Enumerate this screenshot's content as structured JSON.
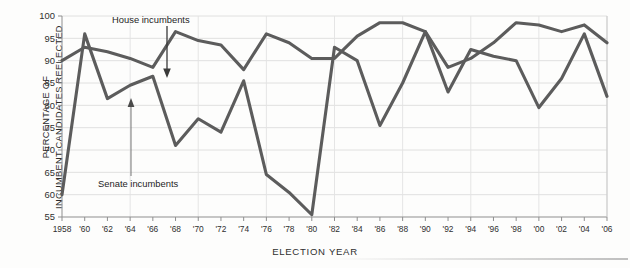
{
  "chart_data": {
    "type": "line",
    "title": "",
    "xlabel": "ELECTION YEAR",
    "ylabel_line1": "PERCENTAGE OF",
    "ylabel_line2": "INCUMBENT CANDIDATES REELECTED",
    "ylim": [
      55,
      100
    ],
    "yticks": [
      55,
      60,
      65,
      70,
      75,
      80,
      85,
      90,
      95,
      100
    ],
    "ytick_labels": [
      "55",
      "60",
      "65",
      "70",
      "75",
      "80",
      "85",
      "90",
      "95",
      "100"
    ],
    "grid": true,
    "legend_position": "inline-annotations",
    "x": [
      1958,
      1960,
      1962,
      1964,
      1966,
      1968,
      1970,
      1972,
      1974,
      1976,
      1978,
      1980,
      1982,
      1984,
      1986,
      1988,
      1990,
      1992,
      1994,
      1996,
      1998,
      2000,
      2002,
      2004,
      2006
    ],
    "xtick_labels": [
      "1958",
      "'60",
      "'62",
      "'64",
      "'66",
      "'68",
      "'70",
      "'72",
      "'74",
      "'76",
      "'78",
      "'80",
      "'82",
      "'84",
      "'86",
      "'88",
      "'90",
      "'92",
      "'94",
      "'96",
      "'98",
      "'00",
      "'02",
      "'04",
      "'06"
    ],
    "series": [
      {
        "name": "House incumbents",
        "color": "#5c5c5c",
        "values": [
          90.0,
          93.0,
          92.0,
          90.5,
          88.5,
          96.5,
          94.5,
          93.5,
          88.0,
          96.0,
          94.0,
          90.5,
          90.5,
          95.5,
          98.5,
          98.5,
          96.5,
          88.5,
          90.5,
          94.0,
          98.5,
          98.0,
          96.5,
          98.0,
          94.0
        ]
      },
      {
        "name": "Senate incumbents",
        "color": "#5c5c5c",
        "values": [
          60.0,
          96.0,
          81.5,
          84.5,
          86.5,
          71.0,
          77.0,
          74.0,
          85.5,
          64.5,
          60.5,
          55.5,
          93.0,
          90.0,
          75.5,
          85.0,
          96.5,
          83.0,
          92.5,
          91.0,
          90.0,
          79.5,
          86.0,
          96.0,
          82.0
        ]
      }
    ],
    "annotations": [
      {
        "label": "House incumbents",
        "points_to_year": 1966,
        "points_to_value": 88.5
      },
      {
        "label": "Senate incumbents",
        "points_to_year": 1962,
        "points_to_value": 81.5
      }
    ]
  }
}
